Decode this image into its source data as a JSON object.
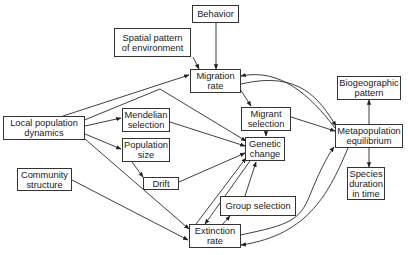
{
  "diagram": {
    "nodes": {
      "behavior": {
        "label": [
          "Behavior"
        ]
      },
      "spatial_pattern": {
        "label": [
          "Spatial pattern",
          "of environment"
        ]
      },
      "migration_rate": {
        "label": [
          "Migration",
          "rate"
        ]
      },
      "biogeographic_pattern": {
        "label": [
          "Biogeographic",
          "pattern"
        ]
      },
      "local_population_dynamics": {
        "label": [
          "Local population",
          "dynamics"
        ]
      },
      "mendelian_selection": {
        "label": [
          "Mendelian",
          "selection"
        ]
      },
      "migrant_selection": {
        "label": [
          "Migrant",
          "selection"
        ]
      },
      "metapopulation_equilibrium": {
        "label": [
          "Metapopulation",
          "equilibrium"
        ]
      },
      "population_size": {
        "label": [
          "Population",
          "size"
        ]
      },
      "genetic_change": {
        "label": [
          "Genetic",
          "change"
        ]
      },
      "drift": {
        "label": [
          "Drift"
        ]
      },
      "community_structure": {
        "label": [
          "Community",
          "structure"
        ]
      },
      "species_duration": {
        "label": [
          "Species",
          "duration",
          "in time"
        ]
      },
      "group_selection": {
        "label": [
          "Group selection"
        ]
      },
      "extinction_rate": {
        "label": [
          "Extinction",
          "rate"
        ]
      }
    },
    "edges": [
      {
        "from": "behavior",
        "to": "migration_rate"
      },
      {
        "from": "spatial_pattern",
        "to": "migration_rate"
      },
      {
        "from": "local_population_dynamics",
        "to": "migration_rate"
      },
      {
        "from": "local_population_dynamics",
        "to": "genetic_change"
      },
      {
        "from": "local_population_dynamics",
        "to": "mendelian_selection"
      },
      {
        "from": "local_population_dynamics",
        "to": "population_size"
      },
      {
        "from": "local_population_dynamics",
        "to": "extinction_rate"
      },
      {
        "from": "mendelian_selection",
        "to": "genetic_change"
      },
      {
        "from": "population_size",
        "to": "drift"
      },
      {
        "from": "drift",
        "to": "genetic_change"
      },
      {
        "from": "community_structure",
        "to": "extinction_rate"
      },
      {
        "from": "migration_rate",
        "to": "migrant_selection"
      },
      {
        "from": "migrant_selection",
        "to": "genetic_change"
      },
      {
        "from": "migrant_selection",
        "to": "metapopulation_equilibrium"
      },
      {
        "from": "metapopulation_equilibrium",
        "to": "migration_rate"
      },
      {
        "from": "migration_rate",
        "to": "metapopulation_equilibrium"
      },
      {
        "from": "metapopulation_equilibrium",
        "to": "biogeographic_pattern"
      },
      {
        "from": "metapopulation_equilibrium",
        "to": "species_duration"
      },
      {
        "from": "genetic_change",
        "to": "extinction_rate"
      },
      {
        "from": "extinction_rate",
        "to": "genetic_change"
      },
      {
        "from": "extinction_rate",
        "to": "group_selection"
      },
      {
        "from": "group_selection",
        "to": "genetic_change"
      },
      {
        "from": "extinction_rate",
        "to": "metapopulation_equilibrium"
      },
      {
        "from": "metapopulation_equilibrium",
        "to": "extinction_rate"
      }
    ]
  }
}
